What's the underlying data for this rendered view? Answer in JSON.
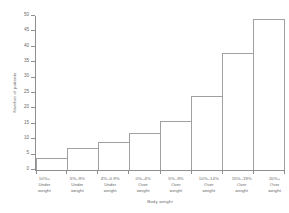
{
  "chart_data": {
    "type": "bar",
    "title": "",
    "xlabel": "Body weight",
    "ylabel": "Number of patients",
    "ylim": [
      0,
      50
    ],
    "ytick_values": [
      0,
      5,
      10,
      15,
      20,
      25,
      30,
      35,
      40,
      45,
      50
    ],
    "ytick_labels": [
      "0",
      "5",
      "10",
      "15",
      "20",
      "25",
      "30",
      "35",
      "40",
      "45",
      "50"
    ],
    "grid": false,
    "legend": false,
    "categories": [
      "10%+ Under weight",
      "5%–9% Under weight",
      "4%–0.9% Under weight",
      "0%–4% Over weight",
      "5%–9% Over weight",
      "10%–14% Over weight",
      "15%–19% Over weight",
      "20%+ Over weight"
    ],
    "category_lines": [
      [
        "10%+",
        "Under",
        "weight"
      ],
      [
        "5%–9%",
        "Under",
        "weight"
      ],
      [
        "4%–0.9%",
        "Under",
        "weight"
      ],
      [
        "0%–4%",
        "Over",
        "weight"
      ],
      [
        "5%–9%",
        "Over",
        "weight"
      ],
      [
        "10%–14%",
        "Over",
        "weight"
      ],
      [
        "15%–19%",
        "Over",
        "weight"
      ],
      [
        "20%+",
        "Over",
        "weight"
      ]
    ],
    "values": [
      4,
      7,
      9,
      12,
      16,
      24,
      38,
      49
    ],
    "bar_edge_color": "#a0a0a0",
    "bar_fill_color": "#ffffff",
    "axis_color": "#8f8f8f",
    "text_color": "#6a6a6a"
  }
}
